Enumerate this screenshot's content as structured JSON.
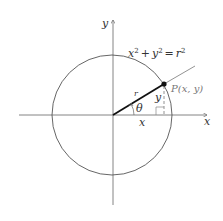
{
  "diagram": {
    "type": "polar-coordinates-circle",
    "equation": {
      "lhs_x": "x",
      "lhs_x_exp": "2",
      "plus": "+",
      "lhs_y": "y",
      "lhs_y_exp": "2",
      "equals": "=",
      "rhs": "r",
      "rhs_exp": "2"
    },
    "axes": {
      "x_label": "x",
      "y_label": "y"
    },
    "point": {
      "label": "P(x, y)"
    },
    "segment_labels": {
      "radius": "r",
      "angle": "θ",
      "horizontal": "x",
      "vertical": "y"
    },
    "colors": {
      "line": "#444444",
      "radius": "#111111",
      "label": "#333333",
      "point_label": "#777777"
    }
  }
}
